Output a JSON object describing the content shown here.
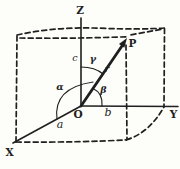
{
  "figure": {
    "axes": {
      "x": "X",
      "y": "Y",
      "z": "Z"
    },
    "points": {
      "origin": "O",
      "tip": "P"
    },
    "vector": {
      "label": "r"
    },
    "components": {
      "x": "a",
      "y": "b",
      "z": "c"
    },
    "angles": {
      "alpha": "α",
      "beta": "β",
      "gamma": "γ"
    },
    "colors": {
      "ink": "#1f1f1f",
      "background": "#fdfdfa"
    }
  }
}
